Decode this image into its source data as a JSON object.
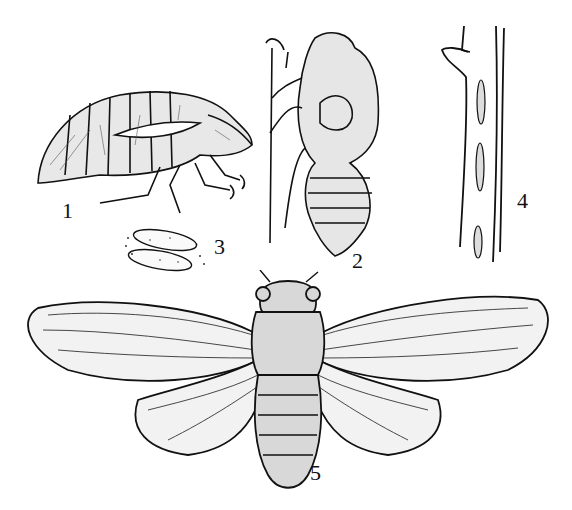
{
  "illustration": {
    "subject": "Cicada life stages engraving",
    "ink_color": "#111111",
    "paper_color": "#ffffff",
    "figures": [
      {
        "number": "1",
        "depicts": "nymph (side view)"
      },
      {
        "number": "2",
        "depicts": "nymph climbing a stem"
      },
      {
        "number": "3",
        "depicts": "eggs"
      },
      {
        "number": "4",
        "depicts": "twig with egg slits"
      },
      {
        "number": "5",
        "depicts": "adult cicada with wings spread"
      }
    ]
  }
}
